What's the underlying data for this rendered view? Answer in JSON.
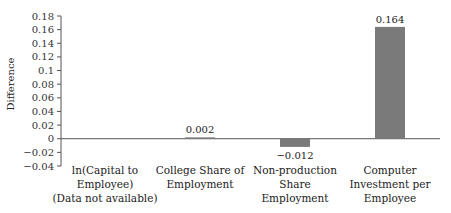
{
  "chart_data": {
    "type": "bar",
    "title": "",
    "xlabel": "",
    "ylabel": "Difference",
    "ylim": [
      -0.04,
      0.18
    ],
    "yticks": [
      0.18,
      0.16,
      0.14,
      0.12,
      0.1,
      0.08,
      0.06,
      0.04,
      0.02,
      0,
      -0.02,
      -0.04
    ],
    "ytick_labels": [
      "0.18",
      "0.16",
      "0.14",
      "0.12",
      "0.1",
      "0.08",
      "0.06",
      "0.04",
      "0.02",
      "0",
      "-0.02",
      "-0.04"
    ],
    "categories": [
      "ln(Capital to Employee) (Data not available)",
      "College Share of Employment",
      "Non-production Share Employment",
      "Computer Investment per Employee"
    ],
    "category_lines": [
      [
        "ln(Capital to",
        "Employee)",
        "(Data not available)"
      ],
      [
        "College Share of",
        "Employment"
      ],
      [
        "Non-production",
        "Share",
        "Employment"
      ],
      [
        "Computer",
        "Investment per",
        "Employee"
      ]
    ],
    "values": [
      null,
      0.002,
      -0.012,
      0.164
    ],
    "value_labels": [
      "",
      "0.002",
      "-0.012",
      "0.164"
    ],
    "bar_color": "#7a7a7a",
    "grid": false,
    "legend": null
  }
}
